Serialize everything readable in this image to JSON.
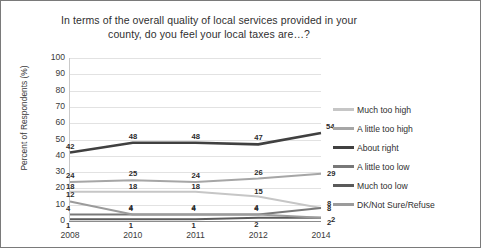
{
  "chart_data": {
    "type": "line",
    "title_line1": "In terms of the overall quality of local services provided in your",
    "title_line2": "county, do you feel your local taxes are…?",
    "xlabel": "",
    "ylabel": "Percent of Respondents (%)",
    "categories": [
      "2008",
      "2010",
      "2011",
      "2012",
      "2014"
    ],
    "ylim": [
      0,
      100
    ],
    "yticks": [
      "100",
      "90",
      "80",
      "70",
      "60",
      "50",
      "40",
      "30",
      "20",
      "10",
      "0"
    ],
    "grid": true,
    "legend_position": "right",
    "series": [
      {
        "name": "Much too high",
        "values": [
          18,
          18,
          18,
          15,
          8
        ],
        "color": "#c6c6c6"
      },
      {
        "name": "A little too high",
        "values": [
          24,
          25,
          24,
          26,
          29
        ],
        "color": "#a6a6a6"
      },
      {
        "name": "About right",
        "values": [
          42,
          48,
          48,
          47,
          54
        ],
        "color": "#404040"
      },
      {
        "name": "A little too low",
        "values": [
          4,
          4,
          4,
          4,
          8
        ],
        "color": "#787878"
      },
      {
        "name": "Much too low",
        "values": [
          1,
          1,
          1,
          2,
          2
        ],
        "color": "#5a5a5a"
      },
      {
        "name": "DK/Not Sure/Refuse",
        "values": [
          12,
          4,
          4,
          4,
          2
        ],
        "color": "#9b9b9b"
      }
    ]
  }
}
